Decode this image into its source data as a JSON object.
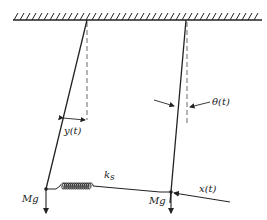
{
  "diagram": {
    "type": "coupled-pendulums-with-spring",
    "labels": {
      "y": "y(t)",
      "spring_constant": "k",
      "spring_constant_sub": "s",
      "theta": "θ(t)",
      "x": "x(t)",
      "left_weight": "Mg",
      "right_weight": "Mg"
    },
    "colors": {
      "line": "#222222",
      "dash": "#444444",
      "background": "#ffffff"
    }
  }
}
